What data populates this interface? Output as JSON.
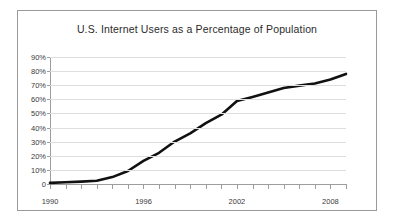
{
  "chart_data": {
    "type": "line",
    "title": "U.S. Internet Users as a Percentage of Population",
    "xlabel": "",
    "ylabel": "",
    "grid": true,
    "legend": "none",
    "xlim": [
      1990,
      2009
    ],
    "ylim": [
      0,
      90
    ],
    "ytick_labels": [
      "90%",
      "80%",
      "70%",
      "60%",
      "50%",
      "40%",
      "30%",
      "20%",
      "10%",
      "0"
    ],
    "ytick_values": [
      90,
      80,
      70,
      60,
      50,
      40,
      30,
      20,
      10,
      0
    ],
    "xtick_labels": [
      "1990",
      "1996",
      "2002",
      "2008"
    ],
    "xtick_values": [
      1990,
      1996,
      2002,
      2008
    ],
    "line_color": "#111111",
    "grid_color": "#dedede",
    "axis_color": "#9d9d9d",
    "x": [
      1990,
      1991,
      1992,
      1993,
      1994,
      1995,
      1996,
      1997,
      1998,
      1999,
      2000,
      2001,
      2002,
      2003,
      2004,
      2005,
      2006,
      2007,
      2008,
      2009
    ],
    "values": [
      0.8,
      1.2,
      1.7,
      2.3,
      4.9,
      9.2,
      16.4,
      22.1,
      30.1,
      35.9,
      43.1,
      49.1,
      58.8,
      61.7,
      64.8,
      68.0,
      69.7,
      71.2,
      74.0,
      78.0
    ],
    "series": [
      {
        "name": "U.S. Internet Users (% of population)",
        "values": [
          0.8,
          1.2,
          1.7,
          2.3,
          4.9,
          9.2,
          16.4,
          22.1,
          30.1,
          35.9,
          43.1,
          49.1,
          58.8,
          61.7,
          64.8,
          68.0,
          69.7,
          71.2,
          74.0,
          78.0
        ]
      }
    ]
  }
}
